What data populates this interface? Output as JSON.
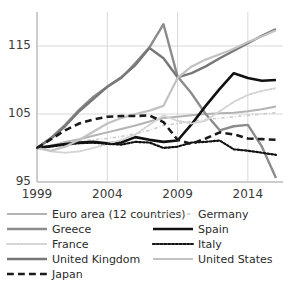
{
  "chart_data": {
    "type": "line",
    "title": "",
    "xlabel": "",
    "ylabel": "",
    "xlim": [
      1999,
      2016.5
    ],
    "ylim": [
      95,
      120
    ],
    "yticks": [
      95,
      105,
      115
    ],
    "xticks": [
      1999,
      2004,
      2009,
      2014
    ],
    "grid": "both",
    "legend_position": "bottom",
    "x": [
      1999,
      2000,
      2001,
      2002,
      2003,
      2004,
      2005,
      2006,
      2007,
      2008,
      2009,
      2010,
      2011,
      2012,
      2013,
      2014,
      2015,
      2016
    ],
    "series": [
      {
        "name": "Euro area (12 countries)",
        "color": "#b3b3b3",
        "style": "solid",
        "width": 2.0,
        "values": [
          100.0,
          100.3,
          100.9,
          101.3,
          101.8,
          102.3,
          102.8,
          103.3,
          103.9,
          104.4,
          104.6,
          104.8,
          105.0,
          105.1,
          105.2,
          105.4,
          105.7,
          106.1
        ]
      },
      {
        "name": "Germany",
        "color": "#cccccc",
        "style": "dashdot",
        "width": 1.6,
        "values": [
          100.0,
          100.4,
          100.8,
          101.0,
          101.2,
          101.4,
          101.7,
          102.1,
          102.6,
          103.3,
          103.6,
          103.9,
          104.2,
          104.4,
          104.6,
          104.8,
          105.0,
          105.2
        ]
      },
      {
        "name": "Greece",
        "color": "#8c8c8c",
        "style": "solid",
        "width": 2.4,
        "values": [
          100.0,
          101.5,
          103.4,
          105.6,
          107.5,
          109.0,
          110.3,
          112.5,
          114.8,
          118.2,
          110.5,
          108.0,
          105.0,
          102.6,
          103.2,
          103.4,
          100.2,
          95.6
        ]
      },
      {
        "name": "Spain",
        "color": "#111111",
        "style": "solid",
        "width": 2.6,
        "values": [
          100.0,
          100.3,
          100.6,
          100.8,
          100.9,
          100.7,
          100.8,
          101.6,
          101.2,
          100.9,
          101.1,
          103.5,
          106.2,
          108.7,
          111.0,
          110.3,
          109.9,
          110.0
        ]
      },
      {
        "name": "France",
        "color": "#d4d4d4",
        "style": "dotted",
        "width": 2.0,
        "values": [
          100.0,
          99.5,
          99.3,
          99.5,
          100.0,
          100.6,
          101.2,
          102.0,
          103.4,
          104.8,
          104.0,
          103.6,
          104.0,
          105.4,
          106.8,
          107.8,
          108.4,
          108.8
        ]
      },
      {
        "name": "Italy",
        "color": "#111111",
        "style": "dotted",
        "width": 2.2,
        "values": [
          100.0,
          100.2,
          100.5,
          100.7,
          100.8,
          100.6,
          100.5,
          100.9,
          100.8,
          100.0,
          100.2,
          100.8,
          100.9,
          101.1,
          99.8,
          99.6,
          99.3,
          99.0
        ]
      },
      {
        "name": "United Kingdom",
        "color": "#777777",
        "style": "solid",
        "width": 2.4,
        "values": [
          100.0,
          101.4,
          103.2,
          105.4,
          107.2,
          109.0,
          110.4,
          112.2,
          114.7,
          113.2,
          110.4,
          111.0,
          112.0,
          113.2,
          114.3,
          115.4,
          116.5,
          117.5
        ]
      },
      {
        "name": "United States",
        "color": "#c2c2c2",
        "style": "solid",
        "width": 2.2,
        "values": [
          100.0,
          99.6,
          100.2,
          101.2,
          102.4,
          103.6,
          104.4,
          105.0,
          105.5,
          106.2,
          110.3,
          112.0,
          113.0,
          113.8,
          114.6,
          115.6,
          116.4,
          117.3
        ]
      },
      {
        "name": "Japan",
        "color": "#1a1a1a",
        "style": "dashed",
        "width": 2.6,
        "values": [
          100.0,
          101.3,
          102.6,
          103.6,
          104.2,
          104.6,
          104.7,
          104.7,
          104.8,
          103.8,
          101.2,
          100.6,
          101.4,
          102.3,
          102.0,
          101.4,
          101.3,
          101.2
        ]
      }
    ]
  },
  "axes": {
    "ytick_labels": [
      "115",
      "105",
      "95"
    ],
    "xtick_labels": [
      "1999",
      "2004",
      "2009",
      "2014"
    ]
  },
  "legend": {
    "items": [
      {
        "label": "Euro area (12 countries)",
        "series": "Euro area (12 countries)"
      },
      {
        "label": "Germany",
        "series": "Germany"
      },
      {
        "label": "Greece",
        "series": "Greece"
      },
      {
        "label": "Spain",
        "series": "Spain"
      },
      {
        "label": "France",
        "series": "France"
      },
      {
        "label": "Italy",
        "series": "Italy"
      },
      {
        "label": "United Kingdom",
        "series": "United Kingdom"
      },
      {
        "label": "United States",
        "series": "United States"
      },
      {
        "label": "Japan",
        "series": "Japan"
      }
    ]
  }
}
